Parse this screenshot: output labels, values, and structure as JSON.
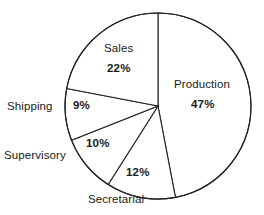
{
  "chart_data": {
    "type": "pie",
    "title": "",
    "subtitle": "",
    "xlabel": "",
    "ylabel": "",
    "legend": "none",
    "grid": false,
    "units": "percent",
    "total": 100,
    "start_angle_deg": 0,
    "direction": "clockwise",
    "categories": [
      "Production",
      "Secretarial",
      "Supervisory",
      "Shipping",
      "Sales"
    ],
    "values": [
      47,
      12,
      10,
      9,
      22
    ],
    "slices": [
      {
        "name": "Production",
        "value": 47,
        "label": "Production",
        "percent_label": "47%",
        "label_position": "inside",
        "percent_position": "inside"
      },
      {
        "name": "Secretarial",
        "value": 12,
        "label": "Secretarial",
        "percent_label": "12%",
        "label_position": "outside-bottom",
        "percent_position": "inside"
      },
      {
        "name": "Supervisory",
        "value": 10,
        "label": "Supervisory",
        "percent_label": "10%",
        "label_position": "outside-left",
        "percent_position": "inside"
      },
      {
        "name": "Shipping",
        "value": 9,
        "label": "Shipping",
        "percent_label": "9%",
        "label_position": "outside-left",
        "percent_position": "inside"
      },
      {
        "name": "Sales",
        "value": 22,
        "label": "Sales",
        "percent_label": "22%",
        "label_position": "inside",
        "percent_position": "inside"
      }
    ],
    "colors": {
      "slice_fill": "#ffffff",
      "outline": "#222222",
      "text": "#1a1a1a",
      "background": "#ffffff"
    }
  },
  "geometry": {
    "center_x": 158,
    "center_y": 106,
    "radius": 93,
    "stroke_width": 1.1
  }
}
